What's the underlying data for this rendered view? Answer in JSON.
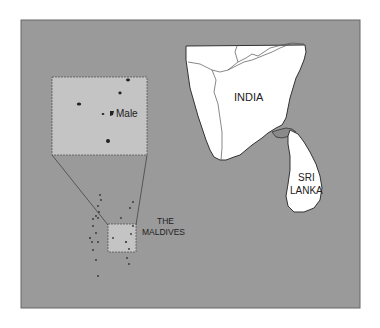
{
  "map": {
    "labels": {
      "india": "INDIA",
      "sri_lanka_line1": "SRI",
      "sri_lanka_line2": "LANKA",
      "maldives_line1": "THE",
      "maldives_line2": "MALDIVES",
      "male": "Male"
    },
    "colors": {
      "sea": "#9a9a9a",
      "land": "#ffffff",
      "inset": "#c4c4c4",
      "outline": "#333333"
    }
  }
}
